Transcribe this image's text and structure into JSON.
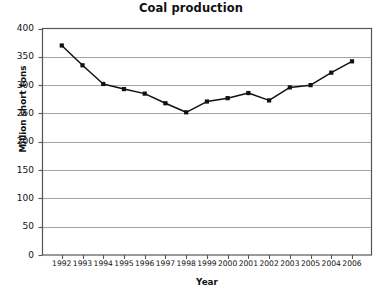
{
  "chart_data": {
    "type": "line",
    "title": "Coal production",
    "xlabel": "Year",
    "ylabel": "Million short tons",
    "categories": [
      "1992",
      "1993",
      "1994",
      "1995",
      "1996",
      "1997",
      "1998",
      "1999",
      "2000",
      "2001",
      "2002",
      "2003",
      "2005",
      "2004",
      "2006"
    ],
    "values": [
      370,
      335,
      302,
      293,
      285,
      268,
      252,
      271,
      277,
      286,
      273,
      296,
      300,
      322,
      342
    ],
    "series": [
      {
        "name": "Coal production",
        "values": [
          370,
          335,
          302,
          293,
          285,
          268,
          252,
          271,
          277,
          286,
          273,
          296,
          300,
          322,
          342
        ]
      }
    ],
    "ylim": [
      0,
      400
    ],
    "yticks": [
      "0",
      "50",
      "100",
      "150",
      "200",
      "250",
      "300",
      "350",
      "400"
    ],
    "ytick_values": [
      0,
      50,
      100,
      150,
      200,
      250,
      300,
      350,
      400
    ],
    "grid": "horizontal",
    "legend": "none",
    "marker": "filled-square",
    "line_color": "#111111",
    "grid_color": "#9a9a9a",
    "axis_color": "#444444",
    "background": "#ffffff"
  }
}
